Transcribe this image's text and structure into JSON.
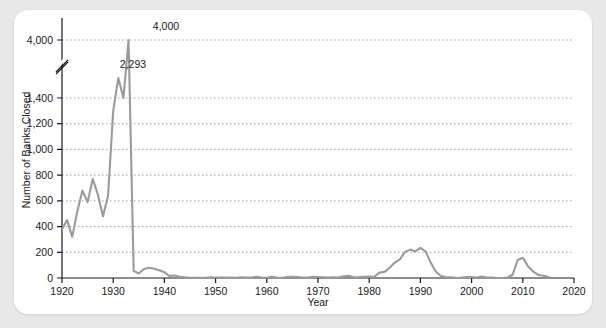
{
  "card": {
    "background_color": "#ffffff",
    "page_background_color": "#e8e8e8"
  },
  "chart_data": {
    "type": "line",
    "title": "",
    "subtitle": "",
    "xlabel": "Year",
    "ylabel": "Number of Banks Closed",
    "xlim": [
      1920,
      2020
    ],
    "ylim": [
      0,
      4000
    ],
    "grid": true,
    "legend_position": "none",
    "line_color": "#9b9b9b",
    "axis_color": "#1a1a1a",
    "gridline_color": "#9b9b9b",
    "gridline_style": "dotted",
    "y_axis_break": {
      "present": true,
      "below": 1400,
      "above": 4000,
      "note": "axis break between 1,400 and 4,000"
    },
    "xticks": [
      1920,
      1930,
      1940,
      1950,
      1960,
      1970,
      1980,
      1990,
      2000,
      2010,
      2020
    ],
    "xtick_labels": [
      "1920",
      "1930",
      "1940",
      "1950",
      "1960",
      "1970",
      "1980",
      "1990",
      "2000",
      "2010",
      "2020"
    ],
    "yticks": [
      0,
      200,
      400,
      600,
      800,
      1000,
      1200,
      1400,
      4000
    ],
    "ytick_labels": [
      "0",
      "200",
      "400",
      "600",
      "800",
      "1,000",
      "1,200",
      "1,400",
      "4,000"
    ],
    "annotations": [
      {
        "text": "4,000",
        "x": 1933,
        "y": 4000
      },
      {
        "text": "2,293",
        "x": 1931,
        "y": 2293
      }
    ],
    "x": [
      1920,
      1921,
      1922,
      1923,
      1924,
      1925,
      1926,
      1927,
      1928,
      1929,
      1930,
      1931,
      1932,
      1933,
      1934,
      1935,
      1936,
      1937,
      1938,
      1939,
      1940,
      1941,
      1942,
      1943,
      1944,
      1945,
      1946,
      1947,
      1948,
      1949,
      1950,
      1951,
      1952,
      1953,
      1954,
      1955,
      1956,
      1957,
      1958,
      1959,
      1960,
      1961,
      1962,
      1963,
      1964,
      1965,
      1966,
      1967,
      1968,
      1969,
      1970,
      1971,
      1972,
      1973,
      1974,
      1975,
      1976,
      1977,
      1978,
      1979,
      1980,
      1981,
      1982,
      1983,
      1984,
      1985,
      1986,
      1987,
      1988,
      1989,
      1990,
      1991,
      1992,
      1993,
      1994,
      1995,
      1996,
      1997,
      1998,
      1999,
      2000,
      2001,
      2002,
      2003,
      2004,
      2005,
      2006,
      2007,
      2008,
      2009,
      2010,
      2011,
      2012,
      2013,
      2014,
      2015
    ],
    "values": [
      380,
      450,
      320,
      520,
      680,
      590,
      770,
      650,
      480,
      640,
      1300,
      2293,
      1400,
      4000,
      55,
      35,
      70,
      80,
      72,
      60,
      45,
      15,
      20,
      10,
      5,
      2,
      2,
      2,
      2,
      5,
      4,
      3,
      3,
      3,
      2,
      5,
      3,
      3,
      9,
      3,
      2,
      9,
      3,
      2,
      8,
      9,
      8,
      4,
      3,
      9,
      8,
      6,
      3,
      6,
      4,
      14,
      17,
      6,
      7,
      10,
      11,
      10,
      42,
      48,
      80,
      120,
      145,
      203,
      221,
      207,
      235,
      208,
      120,
      50,
      15,
      8,
      6,
      1,
      3,
      8,
      7,
      4,
      11,
      3,
      4,
      0,
      0,
      3,
      25,
      140,
      157,
      92,
      51,
      24,
      18,
      8
    ]
  }
}
